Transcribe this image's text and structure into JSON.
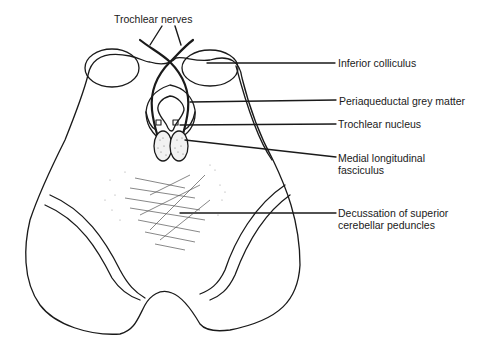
{
  "figure": {
    "type": "anatomical-diagram",
    "line_color": "#1a1a1a",
    "background": "#ffffff"
  },
  "labels": {
    "top": {
      "text": "Trochlear nerves"
    },
    "right": [
      {
        "text": "Inferior colliculus"
      },
      {
        "text": "Periaqueductal grey matter"
      },
      {
        "text": "Trochlear nucleus"
      },
      {
        "line1": "Medial longitudinal",
        "line2": "fasciculus"
      },
      {
        "line1": "Decussation of superior",
        "line2": "cerebellar peduncles"
      }
    ]
  }
}
